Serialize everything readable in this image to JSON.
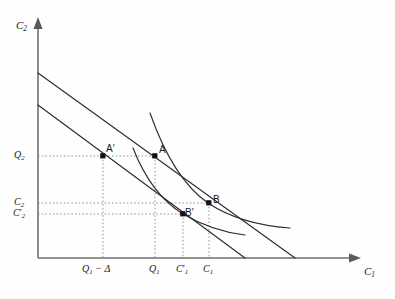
{
  "figure": {
    "kind": "economics-indifference-curve-diagram",
    "background_color": "#fefefe",
    "line_color": "#2c2c2c",
    "axis_color": "#6e6e6e",
    "guide_color": "#8a8a8a"
  },
  "axes": {
    "y_label": "C",
    "y_label_sub": "2",
    "x_label": "C",
    "x_label_sub": "1",
    "origin": {
      "x": 38,
      "y": 258
    },
    "x_end": 360,
    "y_top": 22
  },
  "y_ticks": [
    {
      "name": "Q2",
      "base": "Q",
      "sub": "2",
      "prime": "",
      "y": 156
    },
    {
      "name": "C2",
      "base": "C",
      "sub": "2",
      "prime": "",
      "y": 203
    },
    {
      "name": "C2prime",
      "base": "C",
      "sub": "2",
      "prime": "′",
      "y": 214
    }
  ],
  "x_ticks": [
    {
      "name": "Q1-minus-delta",
      "base": "Q",
      "sub": "1",
      "suffix": " − Δ",
      "x": 103
    },
    {
      "name": "Q1",
      "base": "Q",
      "sub": "1",
      "suffix": "",
      "x": 155
    },
    {
      "name": "C1prime",
      "base": "C",
      "sub": "1",
      "prime": "′",
      "suffix": "",
      "x": 183
    },
    {
      "name": "C1",
      "base": "C",
      "sub": "1",
      "suffix": "",
      "x": 209
    }
  ],
  "points": [
    {
      "name": "A-prime",
      "label": "A′",
      "x": 103,
      "y": 156
    },
    {
      "name": "A",
      "label": "A",
      "x": 155,
      "y": 156
    },
    {
      "name": "B-prime",
      "label": "B′",
      "x": 183,
      "y": 214
    },
    {
      "name": "B",
      "label": "B",
      "x": 209,
      "y": 203
    }
  ],
  "budget_lines": [
    {
      "name": "outer-budget-line",
      "x1": 38,
      "y1": 73,
      "x2": 295,
      "y2": 258
    },
    {
      "name": "inner-budget-line",
      "x1": 38,
      "y1": 105,
      "x2": 245,
      "y2": 258
    }
  ],
  "indifference_curves": [
    {
      "name": "upper-indifference-curve",
      "path": "M 150,113 C 163,150 182,185 208,203 C 232,219 262,226 290,228"
    },
    {
      "name": "lower-indifference-curve",
      "path": "M 133,148 C 144,176 160,200 183,214 C 205,227 228,233 245,235"
    }
  ]
}
